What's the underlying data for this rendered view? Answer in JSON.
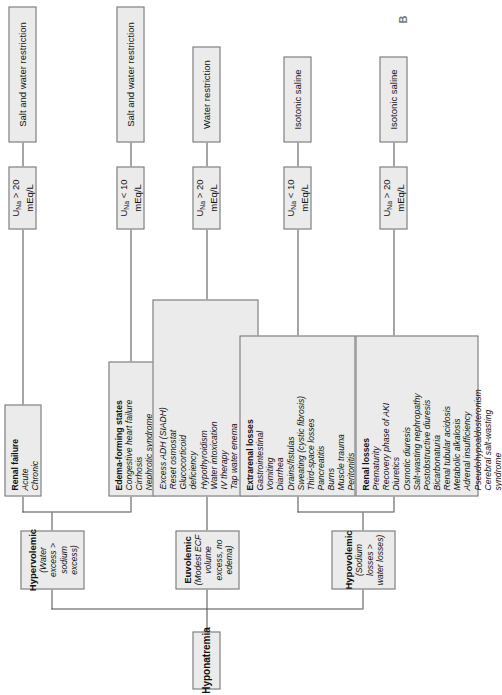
{
  "figure": {
    "panel_label": "B",
    "root": {
      "title": "Hyponatremia"
    }
  },
  "levels": {
    "volume_status": [
      {
        "id": "hypovolemic",
        "title": "Hypovolemic",
        "subtitle": "(Sodium losses > water losses)"
      },
      {
        "id": "euvolemic",
        "title": "Euvolemic",
        "subtitle": "(Modest ECF volume excess, no edema)"
      },
      {
        "id": "hypervolemic",
        "title": "Hypervolemic",
        "subtitle": "(Water excess > sodium excess)"
      }
    ],
    "etiologies": [
      {
        "id": "renal-losses",
        "header": "Renal losses",
        "items": [
          "Prematurity",
          "Recovery phase of AKI",
          "Diuretics",
          "Osmotic diuresis",
          "Salt-wasting nephropathy",
          "Postobstructive diuresis",
          "Bicarbonaturia",
          "Renal tubular acidosis",
          "Metabolic alkalosis",
          "Adrenal insufficiency",
          "Pseudohypoaldosteronism",
          "Cerebral salt-wasting syndrome"
        ]
      },
      {
        "id": "extrarenal-losses",
        "header": "Extrarenal losses",
        "items": [
          "Gastrointestinal",
          "Vomiting",
          "Diarrhea",
          "Drains/fistulas",
          "Sweating (cystic fibrosis)",
          "Third-space losses",
          "Pancreatitis",
          "Burns",
          "Muscle trauma",
          "Peritonitis",
          "Effusions",
          "Ascites"
        ]
      },
      {
        "id": "euvolemic-causes",
        "header": "",
        "items": [
          "Excess ADH (SIADH)",
          "Reset osmostat",
          "Glucocorticoid deficiency",
          "Hypothyroidism",
          "Water intoxication",
          "IV therapy",
          "Tap water enema",
          "Psychogenic water-drinking",
          "Infants fed excessive water"
        ]
      },
      {
        "id": "edema-forming-states",
        "header": "Edema-forming states",
        "items": [
          "Congestive heart failure",
          "Cirrhosis",
          "Nephrotic syndrome"
        ]
      },
      {
        "id": "renal-failure",
        "header": "Renal failure",
        "items": [
          "Acute",
          "Chronic"
        ]
      }
    ],
    "urine_sodium": [
      {
        "id": "una-renal-losses",
        "prefix": "U",
        "sub": "Na",
        "value": " > 20 mEq/L"
      },
      {
        "id": "una-extrarenal",
        "prefix": "U",
        "sub": "Na",
        "value": " < 10 mEq/L"
      },
      {
        "id": "una-euvolemic",
        "prefix": "U",
        "sub": "Na",
        "value": " > 20 mEq/L"
      },
      {
        "id": "una-edema-forming",
        "prefix": "U",
        "sub": "Na",
        "value": " < 10 mEq/L"
      },
      {
        "id": "una-renal-failure",
        "prefix": "U",
        "sub": "Na",
        "value": " > 20 mEq/L"
      }
    ],
    "treatments": [
      {
        "id": "tx-renal-losses",
        "label": "Isotonic saline"
      },
      {
        "id": "tx-extrarenal",
        "label": "Isotonic saline"
      },
      {
        "id": "tx-euvolemic",
        "label": "Water restriction"
      },
      {
        "id": "tx-edema-forming",
        "label": "Salt and water restriction"
      },
      {
        "id": "tx-renal-failure",
        "label": "Salt and water restriction"
      }
    ]
  },
  "colors": {
    "box_fill": "#ebebeb",
    "box_border": "#6e6e6e",
    "connector": "#4d4d4d",
    "text": "#111111"
  }
}
